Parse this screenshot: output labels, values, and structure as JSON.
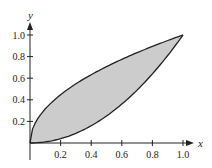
{
  "chart_data": {
    "type": "area",
    "title": "",
    "xlabel": "x",
    "ylabel": "y",
    "xlim": [
      0,
      1.0
    ],
    "ylim": [
      0,
      1.0
    ],
    "grid": false,
    "x_ticks": [
      "0.2",
      "0.4",
      "0.6",
      "0.8",
      "1.0"
    ],
    "y_ticks": [
      "0.2",
      "0.4",
      "0.6",
      "0.8",
      "1.0"
    ],
    "series": [
      {
        "name": "upper curve (y = sqrt x)",
        "x": [
          0,
          0.1,
          0.2,
          0.4,
          0.6,
          0.8,
          1.0
        ],
        "values": [
          0,
          0.32,
          0.45,
          0.63,
          0.77,
          0.89,
          1.0
        ]
      },
      {
        "name": "lower curve (y = x^2)",
        "x": [
          0,
          0.1,
          0.2,
          0.4,
          0.6,
          0.8,
          1.0
        ],
        "values": [
          0,
          0.01,
          0.04,
          0.16,
          0.36,
          0.64,
          1.0
        ]
      }
    ],
    "shaded_region": "between curves from x=0 to x=1",
    "intersections": [
      [
        0,
        0
      ],
      [
        1,
        1
      ]
    ],
    "fill_color": "#cccccc",
    "line_color": "#222222"
  }
}
